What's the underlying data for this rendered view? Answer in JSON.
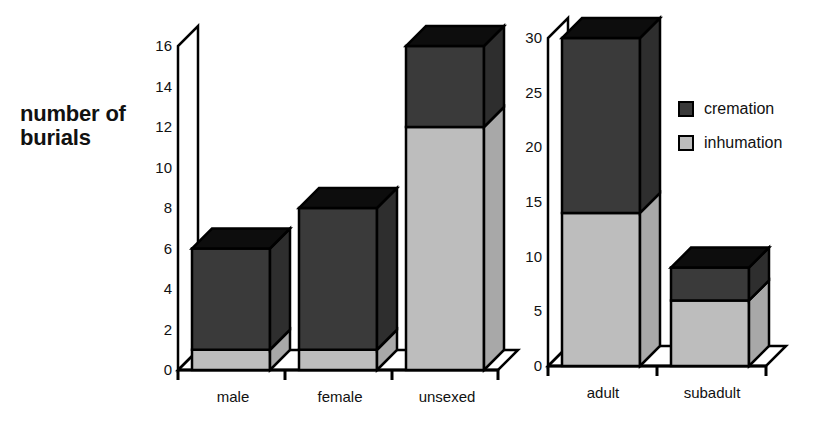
{
  "chart_data": [
    {
      "type": "bar",
      "stacked": true,
      "style": "3d",
      "title": "",
      "xlabel": "",
      "ylabel": "number of burials",
      "ylim": [
        0,
        16
      ],
      "yticks": [
        0,
        2,
        4,
        6,
        8,
        10,
        12,
        14,
        16
      ],
      "categories": [
        "male",
        "female",
        "unsexed"
      ],
      "series": [
        {
          "name": "inhumation",
          "values": [
            1,
            1,
            12
          ]
        },
        {
          "name": "cremation",
          "values": [
            5,
            7,
            4
          ]
        }
      ],
      "totals": [
        6,
        8,
        16
      ],
      "grid": false
    },
    {
      "type": "bar",
      "stacked": true,
      "style": "3d",
      "title": "",
      "xlabel": "",
      "ylabel": "",
      "ylim": [
        0,
        30
      ],
      "yticks": [
        0,
        5,
        10,
        15,
        20,
        25,
        30
      ],
      "categories": [
        "adult",
        "subadult"
      ],
      "series": [
        {
          "name": "inhumation",
          "values": [
            14,
            6
          ]
        },
        {
          "name": "cremation",
          "values": [
            16,
            3
          ]
        }
      ],
      "totals": [
        30,
        9
      ],
      "grid": false
    }
  ],
  "ylabel_lines": [
    "number of",
    "burials"
  ],
  "left_yticks": [
    "0",
    "2",
    "4",
    "6",
    "8",
    "10",
    "12",
    "14",
    "16"
  ],
  "right_yticks": [
    "0",
    "5",
    "10",
    "15",
    "20",
    "25",
    "30"
  ],
  "left_categories": [
    "male",
    "female",
    "unsexed"
  ],
  "right_categories": [
    "adult",
    "subadult"
  ],
  "legend": [
    {
      "label": "cremation",
      "color": "#3a3a3a"
    },
    {
      "label": "inhumation",
      "color": "#bdbdbd"
    }
  ],
  "colors": {
    "cremation": "#3a3a3a",
    "inhumation": "#bdbdbd",
    "top_face": "#0d0d0d",
    "side_dark": "#2e2e2e",
    "side_light": "#a8a8a8"
  }
}
